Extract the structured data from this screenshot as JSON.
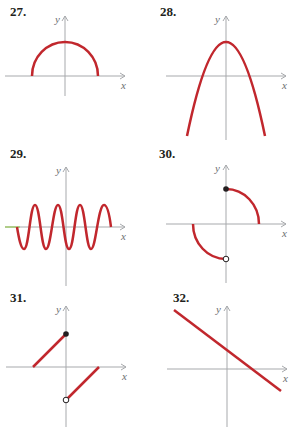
{
  "colors": {
    "curve": "#c1272d",
    "axis": "#a7a9ac",
    "label": "#6d6e71",
    "number": "#231f20"
  },
  "axis_labels": {
    "x": "x",
    "y": "y"
  },
  "graphs": [
    {
      "number": "27.",
      "description": "upper semicircle centered at origin, endpoints on x-axis"
    },
    {
      "number": "28.",
      "description": "downward-opening parabola with vertex on positive y-axis"
    },
    {
      "number": "29.",
      "description": "sine-like wave oscillating about the x-axis"
    },
    {
      "number": "30.",
      "description": "quarter-circle arc in QI with closed dot on y-axis, quarter-circle arc in QIII with open dot on y-axis"
    },
    {
      "number": "31.",
      "description": "line segment in QII ending at closed dot on y-axis, parallel segment in QIV starting at open dot on y-axis"
    },
    {
      "number": "32.",
      "description": "straight line with negative slope, positive y-intercept"
    }
  ]
}
